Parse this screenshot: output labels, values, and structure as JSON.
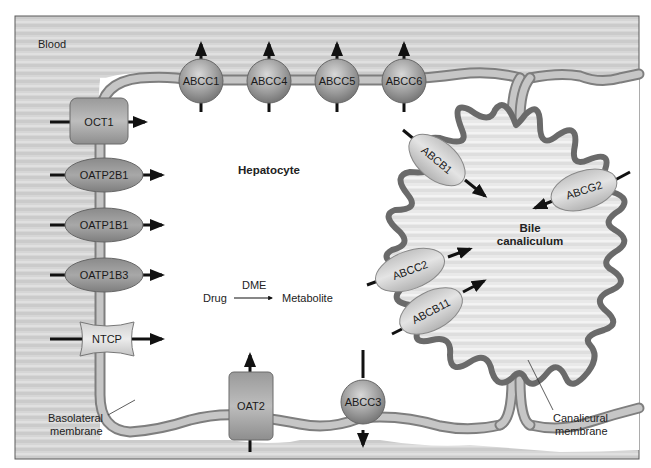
{
  "regions": {
    "blood": "Blood",
    "hepatocyte": "Hepatocyte",
    "bile_canaliculum_line1": "Bile",
    "bile_canaliculum_line2": "canaliculum"
  },
  "metabolism": {
    "enzyme": "DME",
    "substrate": "Drug",
    "product": "Metabolite"
  },
  "membranes": {
    "basolateral_line1": "Basolateral",
    "basolateral_line2": "membrane",
    "canalicular_line1": "Canalicural",
    "canalicular_line2": "membrane"
  },
  "uptake_transporters": [
    {
      "name": "OCT1",
      "shape": "rounded-rect",
      "direction": "into-hepatocyte"
    },
    {
      "name": "OATP2B1",
      "shape": "ellipse",
      "direction": "into-hepatocyte"
    },
    {
      "name": "OATP1B1",
      "shape": "ellipse",
      "direction": "into-hepatocyte"
    },
    {
      "name": "OATP1B3",
      "shape": "ellipse",
      "direction": "into-hepatocyte"
    },
    {
      "name": "NTCP",
      "shape": "barrel",
      "direction": "into-hepatocyte"
    },
    {
      "name": "OAT2",
      "shape": "rounded-rect",
      "direction": "into-hepatocyte"
    }
  ],
  "basolateral_efflux_transporters": [
    {
      "name": "ABCC1",
      "shape": "sphere",
      "direction": "to-blood"
    },
    {
      "name": "ABCC4",
      "shape": "sphere",
      "direction": "to-blood"
    },
    {
      "name": "ABCC5",
      "shape": "sphere",
      "direction": "to-blood"
    },
    {
      "name": "ABCC6",
      "shape": "sphere",
      "direction": "to-blood"
    },
    {
      "name": "ABCC3",
      "shape": "sphere",
      "direction": "to-blood"
    }
  ],
  "canalicular_efflux_transporters": [
    {
      "name": "ABCB1",
      "shape": "ellipse",
      "direction": "into-bile"
    },
    {
      "name": "ABCG2",
      "shape": "ellipse",
      "direction": "into-bile"
    },
    {
      "name": "ABCC2",
      "shape": "ellipse",
      "direction": "into-bile"
    },
    {
      "name": "ABCB11",
      "shape": "ellipse",
      "direction": "into-bile"
    }
  ],
  "colors": {
    "blood_bg": "#d4d4d4",
    "frame": "#5a5a5a",
    "membrane_outer": "#7e7e7e",
    "membrane_inner": "#c6c6c6",
    "canalicular_membrane": "#6a6a6a",
    "transporter_dark": "#8c8c8c",
    "transporter_light": "#cfcfcf",
    "arrow": "#111111"
  }
}
